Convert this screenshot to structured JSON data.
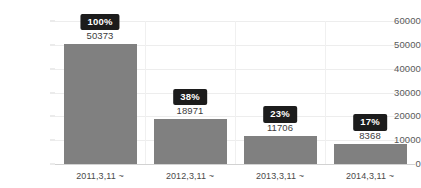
{
  "chart_data": {
    "type": "bar",
    "title": "",
    "subtitle": "",
    "xlabel": "",
    "ylabel": "",
    "categories": [
      "2011,3,11 ~",
      "2012,3,11 ~",
      "2013,3,11 ~",
      "2014,3,11 ~"
    ],
    "values": [
      50373,
      18971,
      11706,
      8368
    ],
    "value_labels": [
      "50373",
      "18971",
      "11706",
      "8368"
    ],
    "percent_labels": [
      "100%",
      "38%",
      "23%",
      "17%"
    ],
    "ylim": [
      0,
      60000
    ],
    "yticks": [
      0,
      10000,
      20000,
      30000,
      40000,
      50000,
      60000
    ],
    "ytick_labels": [
      "0",
      "10000",
      "20000",
      "30000",
      "40000",
      "50000",
      "60000"
    ],
    "grid": true,
    "grid_axis": "y",
    "legend": false,
    "legend_position": "none",
    "bar_color": "#808080",
    "badge_background": "#1c1c1c",
    "badge_text_color": "#ffffff",
    "grid_color": "#ededed",
    "axis_color": "#d2d2d2",
    "background": "#ffffff"
  }
}
